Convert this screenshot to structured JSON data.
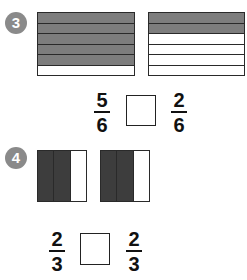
{
  "colors": {
    "shaded_light": "#7d7d7d",
    "shaded_dark": "#3d3d3d",
    "unshaded": "#ffffff",
    "badge": "#8a8a8a"
  },
  "problems": [
    {
      "number": "3",
      "models": [
        {
          "orientation": "horizontal",
          "parts": 6,
          "shaded": 5
        },
        {
          "orientation": "horizontal",
          "parts": 6,
          "shaded": 2
        }
      ],
      "left_fraction": {
        "numerator": "5",
        "denominator": "6"
      },
      "comparison_box": "",
      "right_fraction": {
        "numerator": "2",
        "denominator": "6"
      }
    },
    {
      "number": "4",
      "models": [
        {
          "orientation": "vertical",
          "parts": 3,
          "shaded": 2
        },
        {
          "orientation": "vertical",
          "parts": 3,
          "shaded": 2
        }
      ],
      "left_fraction": {
        "numerator": "2",
        "denominator": "3"
      },
      "comparison_box": "",
      "right_fraction": {
        "numerator": "2",
        "denominator": "3"
      }
    }
  ]
}
